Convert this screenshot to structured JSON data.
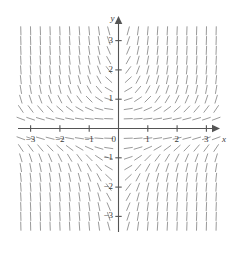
{
  "figure": {
    "kind": "slope-field",
    "background_color": "#ffffff",
    "axis_color": "#555555",
    "segment_color": "#9a9a9a",
    "label_color": "#3a3a3a"
  },
  "axes": {
    "x_axis_label": "x",
    "y_axis_label": "y",
    "origin_label": "0",
    "x_ticks": [
      {
        "value": -3,
        "label": "−3"
      },
      {
        "value": -2,
        "label": "−2"
      },
      {
        "value": -1,
        "label": "−1"
      },
      {
        "value": 1,
        "label": "1"
      },
      {
        "value": 2,
        "label": "2"
      },
      {
        "value": 3,
        "label": "3"
      }
    ],
    "y_ticks": [
      {
        "value": 3,
        "label": "3"
      },
      {
        "value": 2,
        "label": "2"
      },
      {
        "value": 1,
        "label": "1"
      },
      {
        "value": -1,
        "label": "−1"
      },
      {
        "value": -2,
        "label": "−2"
      },
      {
        "value": -3,
        "label": "−3"
      }
    ]
  },
  "chart_data": {
    "type": "scatter",
    "title": "",
    "xlabel": "x",
    "ylabel": "y",
    "xlim": [
      -3.5,
      3.5
    ],
    "ylim": [
      -3.5,
      3.5
    ],
    "grid": false,
    "legend": "none",
    "plot_kind": "slope_field",
    "slope_expression": "dy/dx = x*y*y",
    "sample_step": 0.3333,
    "segment_length_px": 9,
    "x_samples": [
      -3.3333,
      -3.0,
      -2.6667,
      -2.3333,
      -2.0,
      -1.6667,
      -1.3333,
      -1.0,
      -0.6667,
      -0.3333,
      0.3333,
      0.6667,
      1.0,
      1.3333,
      1.6667,
      2.0,
      2.3333,
      2.6667,
      3.0,
      3.3333
    ],
    "y_samples": [
      -3.3333,
      -3.0,
      -2.6667,
      -2.3333,
      -2.0,
      -1.6667,
      -1.3333,
      -1.0,
      -0.6667,
      -0.3333,
      0.3333,
      0.6667,
      1.0,
      1.3333,
      1.6667,
      2.0,
      2.3333,
      2.6667,
      3.0,
      3.3333
    ]
  }
}
